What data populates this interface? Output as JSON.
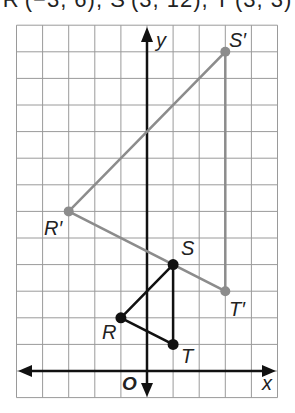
{
  "caption": "R′(−3, 6), S′(3, 12), T′(3, 3)",
  "axes": {
    "x_label": "x",
    "y_label": "y",
    "origin_label": "O"
  },
  "grid": {
    "x_min": -5,
    "x_max": 5,
    "y_min": -1,
    "y_max": 13,
    "step": 1
  },
  "original_triangle": {
    "color": "#111111",
    "points": [
      {
        "label": "R",
        "x": -1,
        "y": 2
      },
      {
        "label": "S",
        "x": 1,
        "y": 4
      },
      {
        "label": "T",
        "x": 1,
        "y": 1
      }
    ]
  },
  "image_triangle": {
    "color": "#8c8c8c",
    "points": [
      {
        "label": "R′",
        "x": -3,
        "y": 6
      },
      {
        "label": "S′",
        "x": 3,
        "y": 12
      },
      {
        "label": "T′",
        "x": 3,
        "y": 3
      }
    ]
  },
  "labels": {
    "R": "R",
    "S": "S",
    "T": "T",
    "Rp": "R′",
    "Sp": "S′",
    "Tp": "T′"
  }
}
